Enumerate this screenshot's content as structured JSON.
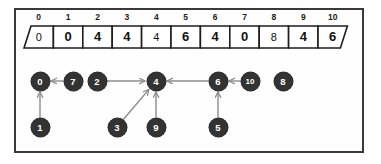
{
  "figure": {
    "border_color": "#3a3a3a",
    "node_color": "#333333",
    "node_text_color": "#ffffff",
    "edge_color": "#8c8c8c",
    "background": "#ffffff"
  },
  "array": {
    "indices": [
      "0",
      "1",
      "2",
      "3",
      "4",
      "5",
      "6",
      "7",
      "8",
      "9",
      "10"
    ],
    "values": [
      "0",
      "0",
      "4",
      "4",
      "4",
      "6",
      "4",
      "0",
      "8",
      "4",
      "6"
    ],
    "value_weights": [
      "thin",
      "bold",
      "bold",
      "bold",
      "thin",
      "bold",
      "bold",
      "bold",
      "thin",
      "bold",
      "bold"
    ]
  },
  "graph": {
    "nodes": [
      {
        "id": "n0",
        "label": "0",
        "x": 40,
        "y": 81,
        "row": "top"
      },
      {
        "id": "n7",
        "label": "7",
        "x": 73,
        "y": 81,
        "row": "top"
      },
      {
        "id": "n2",
        "label": "2",
        "x": 97,
        "y": 81,
        "row": "top"
      },
      {
        "id": "n4",
        "label": "4",
        "x": 156,
        "y": 81,
        "row": "top"
      },
      {
        "id": "n6",
        "label": "6",
        "x": 218,
        "y": 81,
        "row": "top"
      },
      {
        "id": "n10",
        "label": "10",
        "x": 250,
        "y": 81,
        "row": "top"
      },
      {
        "id": "n8",
        "label": "8",
        "x": 283,
        "y": 81,
        "row": "top"
      },
      {
        "id": "n1",
        "label": "1",
        "x": 40,
        "y": 127,
        "row": "bottom"
      },
      {
        "id": "n3",
        "label": "3",
        "x": 117,
        "y": 127,
        "row": "bottom"
      },
      {
        "id": "n9",
        "label": "9",
        "x": 156,
        "y": 127,
        "row": "bottom"
      },
      {
        "id": "n5",
        "label": "5",
        "x": 218,
        "y": 127,
        "row": "bottom"
      }
    ],
    "edges": [
      {
        "from": "7",
        "to": "0",
        "direction": "right-to-left"
      },
      {
        "from": "1",
        "to": "0",
        "direction": "bottom-to-top"
      },
      {
        "from": "2",
        "to": "4",
        "direction": "left-to-right"
      },
      {
        "from": "3",
        "to": "4",
        "direction": "diagonal-up-right"
      },
      {
        "from": "9",
        "to": "4",
        "direction": "bottom-to-top"
      },
      {
        "from": "6",
        "to": "4",
        "direction": "right-to-left"
      },
      {
        "from": "10",
        "to": "6",
        "direction": "right-to-left"
      },
      {
        "from": "5",
        "to": "6",
        "direction": "bottom-to-top"
      }
    ],
    "isolated_nodes": [
      "8",
      "0"
    ]
  }
}
